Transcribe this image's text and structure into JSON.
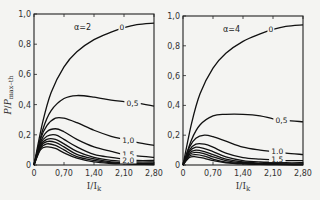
{
  "chart_data": [
    {
      "type": "line",
      "panel_label": "α=2",
      "xlabel": "I/I_k",
      "ylabel": "P/P_max-th",
      "xlim": [
        0,
        2.8
      ],
      "ylim": [
        0,
        1.0
      ],
      "xticks": [
        "0",
        "0,70",
        "1,40",
        "2,10",
        "2,80"
      ],
      "yticks": [
        "0",
        "0,2",
        "0,4",
        "0,6",
        "0,8",
        "1,0"
      ],
      "grid": false,
      "series": [
        {
          "name": "0",
          "x": [
            0,
            0.2,
            0.4,
            0.7,
            1.0,
            1.4,
            1.8,
            2.1,
            2.4,
            2.8
          ],
          "y": [
            0,
            0.28,
            0.48,
            0.65,
            0.75,
            0.83,
            0.88,
            0.91,
            0.93,
            0.94
          ]
        },
        {
          "name": "0,5",
          "x": [
            0,
            0.2,
            0.4,
            0.7,
            1.0,
            1.4,
            1.8,
            2.1,
            2.4,
            2.8
          ],
          "y": [
            0,
            0.23,
            0.36,
            0.44,
            0.46,
            0.45,
            0.43,
            0.42,
            0.41,
            0.39
          ]
        },
        {
          "name": "1,0",
          "x": [
            0,
            0.15,
            0.3,
            0.5,
            0.7,
            1.0,
            1.4,
            1.8,
            2.1,
            2.4,
            2.8
          ],
          "y": [
            0,
            0.17,
            0.26,
            0.31,
            0.31,
            0.28,
            0.23,
            0.19,
            0.17,
            0.15,
            0.13
          ]
        },
        {
          "name": "1,5",
          "x": [
            0,
            0.15,
            0.3,
            0.5,
            0.7,
            1.0,
            1.4,
            1.8,
            2.1,
            2.4,
            2.8
          ],
          "y": [
            0,
            0.15,
            0.22,
            0.24,
            0.22,
            0.17,
            0.12,
            0.09,
            0.07,
            0.06,
            0.05
          ]
        },
        {
          "name": "2,0",
          "x": [
            0,
            0.15,
            0.3,
            0.5,
            0.7,
            1.0,
            1.4,
            1.8,
            2.1,
            2.4,
            2.8
          ],
          "y": [
            0,
            0.14,
            0.19,
            0.2,
            0.17,
            0.12,
            0.07,
            0.05,
            0.04,
            0.03,
            0.03
          ]
        },
        {
          "name": "2,5",
          "x": [
            0,
            0.15,
            0.3,
            0.5,
            0.7,
            1.0,
            1.4,
            1.8,
            2.1,
            2.4,
            2.8
          ],
          "y": [
            0,
            0.13,
            0.17,
            0.17,
            0.14,
            0.09,
            0.05,
            0.03,
            0.025,
            0.02,
            0.02
          ]
        },
        {
          "name": "3,0",
          "x": [
            0,
            0.15,
            0.3,
            0.5,
            0.7,
            1.0,
            1.4,
            1.8,
            2.1,
            2.4,
            2.8
          ],
          "y": [
            0,
            0.12,
            0.155,
            0.15,
            0.12,
            0.07,
            0.04,
            0.02,
            0.015,
            0.01,
            0.01
          ]
        },
        {
          "name": "3,5",
          "x": [
            0,
            0.15,
            0.3,
            0.5,
            0.7,
            1.0,
            1.4,
            1.8,
            2.1,
            2.4,
            2.8
          ],
          "y": [
            0,
            0.11,
            0.14,
            0.13,
            0.1,
            0.055,
            0.03,
            0.015,
            0.01,
            0.008,
            0.005
          ]
        },
        {
          "name": "4,0",
          "x": [
            0,
            0.15,
            0.3,
            0.5,
            0.7,
            1.0,
            1.4,
            1.8,
            2.1,
            2.4,
            2.8
          ],
          "y": [
            0,
            0.1,
            0.12,
            0.11,
            0.08,
            0.045,
            0.02,
            0.01,
            0.007,
            0.005,
            0.003
          ]
        }
      ],
      "curve_labels": [
        {
          "text": "0",
          "x": 2.05,
          "y": 0.91
        },
        {
          "text": "0,5",
          "x": 2.3,
          "y": 0.41
        },
        {
          "text": "1,0",
          "x": 2.2,
          "y": 0.16
        },
        {
          "text": "1,5",
          "x": 2.2,
          "y": 0.07
        },
        {
          "text": "2,0",
          "x": 2.2,
          "y": 0.03
        }
      ]
    },
    {
      "type": "line",
      "panel_label": "α=4",
      "xlabel": "I/I_k",
      "ylabel": "",
      "xlim": [
        0,
        2.8
      ],
      "ylim": [
        0,
        1.0
      ],
      "xticks": [
        "0",
        "0,70",
        "1,40",
        "2,10",
        "2,80"
      ],
      "yticks": [
        "0",
        "0,2",
        "0,4",
        "0,6",
        "0,8",
        "1,0"
      ],
      "grid": false,
      "series": [
        {
          "name": "0",
          "x": [
            0,
            0.2,
            0.4,
            0.7,
            1.0,
            1.4,
            1.8,
            2.1,
            2.4,
            2.8
          ],
          "y": [
            0,
            0.28,
            0.48,
            0.65,
            0.75,
            0.83,
            0.88,
            0.91,
            0.93,
            0.94
          ]
        },
        {
          "name": "0,5",
          "x": [
            0,
            0.2,
            0.4,
            0.7,
            1.0,
            1.4,
            1.8,
            2.1,
            2.4,
            2.8
          ],
          "y": [
            0,
            0.17,
            0.27,
            0.33,
            0.34,
            0.34,
            0.33,
            0.31,
            0.3,
            0.29
          ]
        },
        {
          "name": "1,0",
          "x": [
            0,
            0.15,
            0.3,
            0.5,
            0.7,
            1.0,
            1.4,
            1.8,
            2.1,
            2.4,
            2.8
          ],
          "y": [
            0,
            0.12,
            0.18,
            0.2,
            0.19,
            0.16,
            0.12,
            0.1,
            0.09,
            0.08,
            0.07
          ]
        },
        {
          "name": "1,5",
          "x": [
            0,
            0.15,
            0.3,
            0.5,
            0.7,
            1.0,
            1.4,
            1.8,
            2.1,
            2.4,
            2.8
          ],
          "y": [
            0,
            0.1,
            0.14,
            0.14,
            0.12,
            0.08,
            0.05,
            0.04,
            0.035,
            0.03,
            0.03
          ]
        },
        {
          "name": "2,0",
          "x": [
            0,
            0.15,
            0.3,
            0.5,
            0.7,
            1.0,
            1.4,
            1.8,
            2.1,
            2.4,
            2.8
          ],
          "y": [
            0,
            0.09,
            0.12,
            0.11,
            0.09,
            0.055,
            0.03,
            0.02,
            0.018,
            0.015,
            0.015
          ]
        },
        {
          "name": "2,5",
          "x": [
            0,
            0.15,
            0.3,
            0.5,
            0.7,
            1.0,
            1.4,
            1.8,
            2.1,
            2.4,
            2.8
          ],
          "y": [
            0,
            0.08,
            0.1,
            0.09,
            0.07,
            0.04,
            0.02,
            0.012,
            0.01,
            0.008,
            0.008
          ]
        },
        {
          "name": "3,0",
          "x": [
            0,
            0.15,
            0.3,
            0.5,
            0.7,
            1.0,
            1.4,
            1.8,
            2.1,
            2.4,
            2.8
          ],
          "y": [
            0,
            0.07,
            0.085,
            0.075,
            0.055,
            0.03,
            0.015,
            0.008,
            0.006,
            0.005,
            0.004
          ]
        },
        {
          "name": "3,5",
          "x": [
            0,
            0.15,
            0.3,
            0.5,
            0.7,
            1.0,
            1.4,
            1.8,
            2.1,
            2.4,
            2.8
          ],
          "y": [
            0,
            0.06,
            0.07,
            0.06,
            0.04,
            0.02,
            0.01,
            0.005,
            0.004,
            0.003,
            0.002
          ]
        },
        {
          "name": "4,0",
          "x": [
            0,
            0.15,
            0.3,
            0.5,
            0.7,
            1.0,
            1.4,
            1.8,
            2.1,
            2.4,
            2.8
          ],
          "y": [
            0,
            0.05,
            0.055,
            0.045,
            0.03,
            0.015,
            0.007,
            0.004,
            0.003,
            0.002,
            0.001
          ]
        }
      ],
      "curve_labels": [
        {
          "text": "0",
          "x": 2.05,
          "y": 0.91
        },
        {
          "text": "0,5",
          "x": 2.3,
          "y": 0.3
        },
        {
          "text": "1,0",
          "x": 2.2,
          "y": 0.09
        },
        {
          "text": "1,5",
          "x": 2.2,
          "y": 0.04
        }
      ]
    }
  ],
  "panels": [
    {
      "frame": {
        "left": 34,
        "top": 14,
        "right": 154,
        "bottom": 165
      }
    },
    {
      "frame": {
        "left": 183,
        "top": 16,
        "right": 303,
        "bottom": 165
      }
    }
  ],
  "labels": {
    "ylabel_left": "P/P_max-th",
    "xlabel": "I/I_k"
  }
}
